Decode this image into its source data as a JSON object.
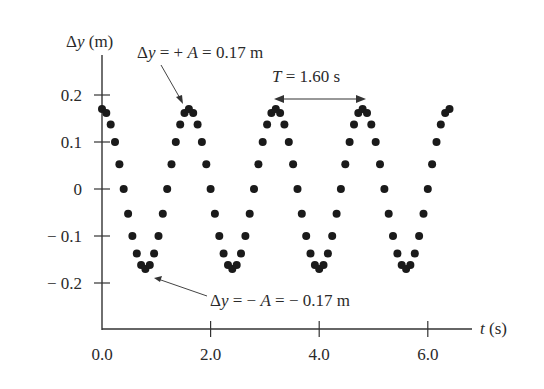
{
  "chart_data": {
    "type": "scatter",
    "title": "",
    "xlabel": "t (s)",
    "ylabel": "Δy (m)",
    "x_ticks": [
      "0.0",
      "2.0",
      "4.0",
      "6.0"
    ],
    "y_ticks": [
      "0.2",
      "0.1",
      "0",
      "− 0.1",
      "− 0.2"
    ],
    "xlim": [
      0,
      7.0
    ],
    "ylim": [
      -0.28,
      0.3
    ],
    "grid": false,
    "series": [
      {
        "name": "Δy(t) = 0.17 cos(2πt/1.60)",
        "amplitude": 0.17,
        "period": 1.6,
        "t_start": 0.0,
        "t_end": 6.4,
        "dt": 0.08
      }
    ],
    "annotations": [
      {
        "text": "Δy = + A = 0.17 m",
        "points_to": [
          1.6,
          0.17
        ]
      },
      {
        "text": "Δy = − A = − 0.17 m",
        "points_to": [
          0.8,
          -0.17
        ]
      },
      {
        "text": "T = 1.60 s",
        "span": [
          3.2,
          4.8
        ],
        "y": 0.17
      }
    ]
  },
  "labels": {
    "ylabel_sym": "Δ",
    "ylabel_var": "y",
    "ylabel_unit": " (m)",
    "xlabel_var": "t",
    "xlabel_unit": " (s)",
    "ann_max_prefix": "Δ",
    "ann_max_var": "y",
    "ann_max_mid": " = + ",
    "ann_max_A": "A",
    "ann_max_val": " = 0.17 m",
    "ann_min_prefix": "Δ",
    "ann_min_var": "y",
    "ann_min_mid": " = − ",
    "ann_min_A": "A",
    "ann_min_val": " = − 0.17 m",
    "period_T": "T",
    "period_val": " = 1.60 s"
  }
}
